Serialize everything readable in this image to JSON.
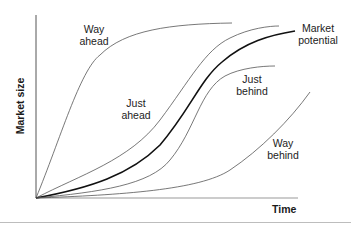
{
  "diagram": {
    "axes": {
      "y_label": "Market size",
      "x_label": "Time"
    },
    "curves": [
      {
        "id": "way-ahead",
        "label_line1": "Way",
        "label_line2": "ahead",
        "style": "thin"
      },
      {
        "id": "just-ahead",
        "label_line1": "Just",
        "label_line2": "ahead",
        "style": "thin"
      },
      {
        "id": "market-potential",
        "label_line1": "Market",
        "label_line2": "potential",
        "style": "thick"
      },
      {
        "id": "just-behind",
        "label_line1": "Just",
        "label_line2": "behind",
        "style": "thin"
      },
      {
        "id": "way-behind",
        "label_line1": "Way",
        "label_line2": "behind",
        "style": "thin"
      }
    ],
    "colors": {
      "axis": "#555555",
      "thin_curve": "#555555",
      "thick_curve": "#111111",
      "text": "#222222",
      "rule": "#bdbdbd"
    }
  }
}
